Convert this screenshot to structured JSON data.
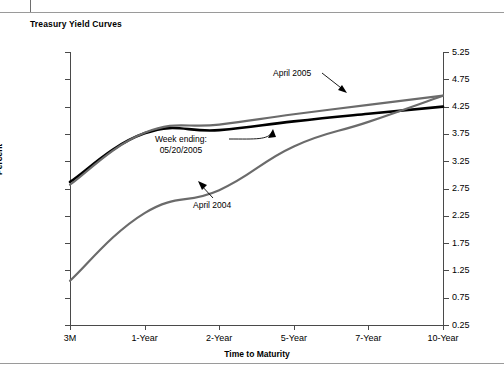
{
  "title": "Treasury Yield Curves",
  "axis": {
    "ylabel": "Percent",
    "xlabel": "Time to Maturity"
  },
  "annotations": {
    "april2005": "April 2005",
    "week_line1": "Week ending:",
    "week_line2": "05/20/2005",
    "april2004": "April 2004"
  },
  "chart_data": {
    "type": "line",
    "title": "Treasury Yield Curves",
    "xlabel": "Time to Maturity",
    "ylabel": "Percent",
    "categories": [
      "3M",
      "1-Year",
      "2-Year",
      "5-Year",
      "7-Year",
      "10-Year"
    ],
    "ylim": [
      0.25,
      5.25
    ],
    "ytick_labels": [
      "0.25",
      "0.75",
      "1.25",
      "1.75",
      "2.25",
      "2.75",
      "3.25",
      "3.75",
      "4.25",
      "4.75",
      "5.25"
    ],
    "ytick_values": [
      0.25,
      0.75,
      1.25,
      1.75,
      2.25,
      2.75,
      3.25,
      3.75,
      4.25,
      4.75,
      5.25
    ],
    "grid": false,
    "legend": "annotated-inline",
    "series": [
      {
        "name": "Week ending: 05/20/2005",
        "color": "#000000",
        "width": 2.6,
        "values": [
          2.87,
          3.76,
          3.82,
          3.98,
          4.12,
          4.25
        ]
      },
      {
        "name": "April 2005",
        "color": "#6b6b6b",
        "width": 2.2,
        "values": [
          2.82,
          3.77,
          3.92,
          4.11,
          4.28,
          4.45
        ]
      },
      {
        "name": "April 2004",
        "color": "#6b6b6b",
        "width": 2.2,
        "values": [
          1.06,
          2.3,
          2.72,
          3.52,
          3.97,
          4.45
        ]
      }
    ]
  }
}
